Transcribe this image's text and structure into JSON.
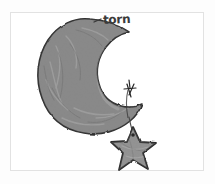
{
  "image": {
    "kind": "hand-drawn-sketch",
    "subject": "crescent moon with hanging star",
    "background_color": "#fdfdfd",
    "frame_color": "#e2e2e2",
    "canvas_color": "#ffffff"
  },
  "annotations": [
    {
      "label": "torn",
      "target": "moon-upper-tip",
      "text_color": "#3a3a3a",
      "leader_line": "horizontal-dash"
    }
  ],
  "objects": {
    "moon": {
      "name": "crescent-moon",
      "fill_color": "#8a8a8a",
      "outline_color": "#2e2e2e",
      "shading": "mottled-grey-texture"
    },
    "star": {
      "name": "five-pointed-star",
      "fill_color": "#949494",
      "outline_color": "#2b2b2b",
      "points": 5
    },
    "string": {
      "name": "hanging-string",
      "color": "#4a4a4a",
      "from": "moon-lower-horn",
      "to": "star-top"
    },
    "stitch": {
      "name": "stitch-knot-mark",
      "color": "#262626",
      "location": "moon-lower-horn"
    }
  }
}
